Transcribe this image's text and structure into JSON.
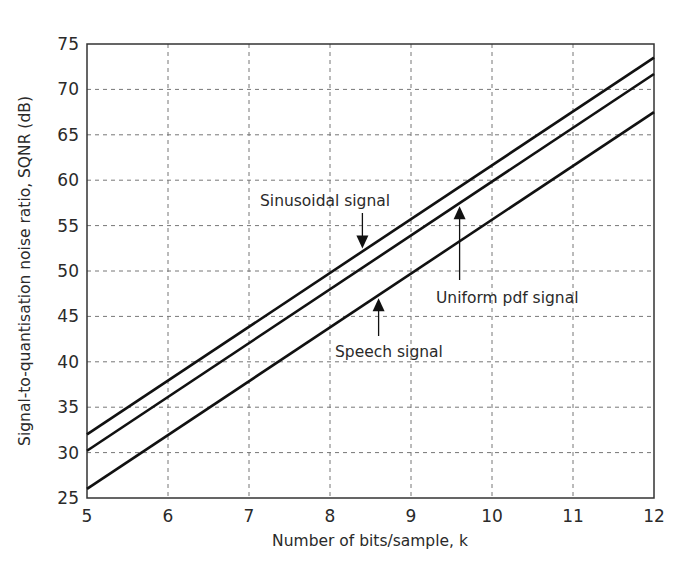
{
  "chart_data": {
    "type": "line",
    "title": "",
    "xlabel": "Number of bits/sample, k",
    "ylabel": "Signal-to-quantisation noise ratio, SQNR (dB)",
    "xlim": [
      5,
      12
    ],
    "ylim": [
      25,
      75
    ],
    "xticks": [
      5,
      6,
      7,
      8,
      9,
      10,
      11,
      12
    ],
    "yticks": [
      25,
      30,
      35,
      40,
      45,
      50,
      55,
      60,
      65,
      70,
      75
    ],
    "grid": true,
    "x": [
      5,
      12
    ],
    "series": [
      {
        "name": "Sinusoidal signal",
        "values": [
          32.0,
          73.5
        ]
      },
      {
        "name": "Uniform pdf signal",
        "values": [
          30.2,
          71.7
        ]
      },
      {
        "name": "Speech signal",
        "values": [
          26.0,
          67.5
        ]
      }
    ],
    "annotations": [
      {
        "text": "Sinusoidal signal",
        "arrow_to": "Sinusoidal signal",
        "at_k": 8.4
      },
      {
        "text": "Uniform pdf signal",
        "arrow_to": "Uniform pdf signal",
        "at_k": 9.6
      },
      {
        "text": "Speech signal",
        "arrow_to": "Speech signal",
        "at_k": 8.6
      }
    ]
  }
}
